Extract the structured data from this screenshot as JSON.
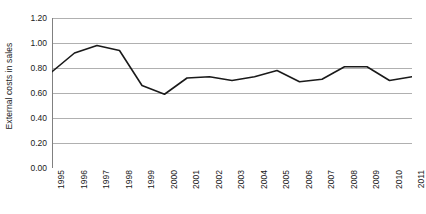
{
  "chart_data": {
    "type": "line",
    "title": "",
    "xlabel": "",
    "ylabel": "External costs in sales",
    "categories": [
      "1995",
      "1996",
      "1997",
      "1998",
      "1999",
      "2000",
      "2001",
      "2002",
      "2003",
      "2004",
      "2005",
      "2006",
      "2007",
      "2008",
      "2009",
      "2010",
      "2011"
    ],
    "values": [
      0.77,
      0.92,
      0.98,
      0.94,
      0.66,
      0.59,
      0.72,
      0.73,
      0.7,
      0.73,
      0.78,
      0.69,
      0.71,
      0.81,
      0.81,
      0.7,
      0.73
    ],
    "series": [
      {
        "name": "External costs in sales",
        "values": [
          0.77,
          0.92,
          0.98,
          0.94,
          0.66,
          0.59,
          0.72,
          0.73,
          0.7,
          0.73,
          0.78,
          0.69,
          0.71,
          0.81,
          0.81,
          0.7,
          0.73
        ]
      }
    ],
    "ylim": [
      0.0,
      1.2
    ],
    "ytick_values": [
      0.0,
      0.2,
      0.4,
      0.6,
      0.8,
      1.0,
      1.2
    ],
    "ytick_labels": [
      "0.00",
      "0.20",
      "0.40",
      "0.60",
      "0.80",
      "1.00",
      "1.20"
    ],
    "grid": "horizontal",
    "legend": "none",
    "line_color": "#1a1a1a",
    "grid_color": "#b0b0b0",
    "axis_color": "#808080",
    "background_color": "#ffffff",
    "markers": false,
    "xtick_rotation": -90
  }
}
